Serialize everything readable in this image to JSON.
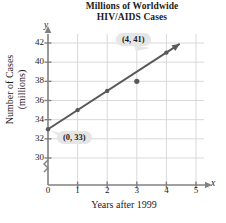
{
  "chart_data": {
    "type": "scatter",
    "title": "Millions of Worldwide HIV/AIDS Cases",
    "title_line1": "Millions of Worldwide",
    "title_line2": "HIV/AIDS Cases",
    "xlabel": "Years after 1999",
    "ylabel": "Number of Cases (millions)",
    "ylabel_line1": "Number of Cases",
    "ylabel_line2": "(millions)",
    "x_axis_letter": "x",
    "y_axis_letter": "y",
    "x": [
      0,
      1,
      2,
      3,
      4
    ],
    "values": [
      33,
      35,
      37,
      38,
      41
    ],
    "points": [
      {
        "x": 0,
        "y": 33,
        "on_line": true
      },
      {
        "x": 1,
        "y": 35,
        "on_line": true
      },
      {
        "x": 2,
        "y": 37,
        "on_line": true
      },
      {
        "x": 3,
        "y": 38,
        "on_line": false
      },
      {
        "x": 4,
        "y": 41,
        "on_line": true
      }
    ],
    "trend_line": {
      "intercept": 33,
      "slope": 2,
      "from_x": 0,
      "to_x": 4.45,
      "arrow": true
    },
    "xlim": [
      0,
      5
    ],
    "ylim": [
      29,
      43
    ],
    "xticks": [
      0,
      1,
      2,
      3,
      4,
      5
    ],
    "yticks": [
      30,
      32,
      34,
      36,
      38,
      40,
      42
    ],
    "xtick_labels": [
      "0",
      "1",
      "2",
      "3",
      "4",
      "5"
    ],
    "ytick_labels": [
      "30",
      "32",
      "34",
      "36",
      "38",
      "40",
      "42"
    ],
    "grid": true,
    "y_axis_break": true,
    "legend": null,
    "annotations": [
      {
        "name": "point-4-41",
        "text": "(4, 41)",
        "points_to": {
          "x": 4,
          "y": 41
        }
      },
      {
        "name": "point-0-33",
        "text": "(0, 33)",
        "points_to": {
          "x": 0,
          "y": 33
        }
      }
    ],
    "colors": {
      "line": "#595959",
      "marker": "#595959",
      "grid": "#d9d9d9",
      "axis": "#808080",
      "callout_bg": "#e6e6e6",
      "text": "#1c1c1c",
      "background": "#ffffff"
    }
  }
}
